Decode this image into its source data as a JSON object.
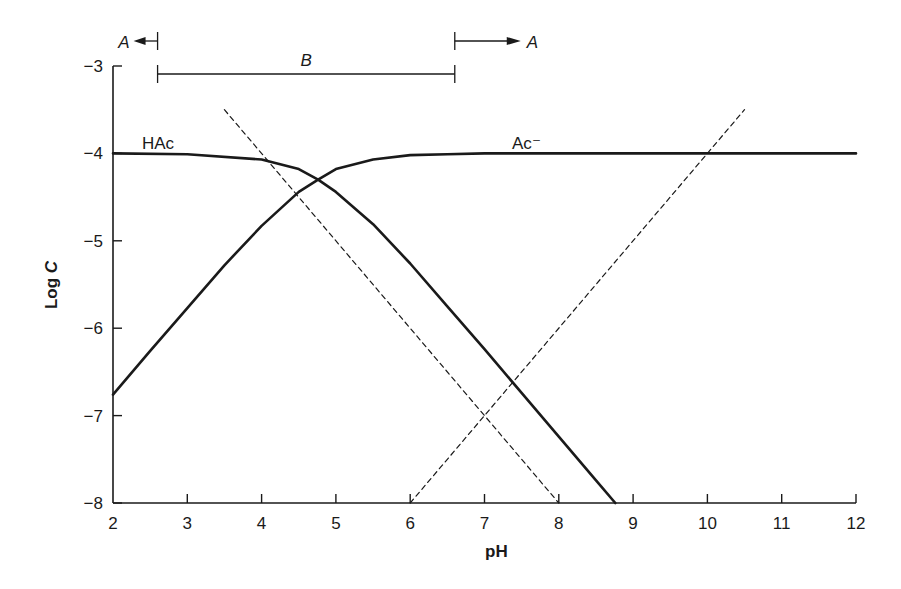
{
  "chart_data": {
    "type": "line",
    "title": "",
    "xlabel": "pH",
    "ylabel": "Log C",
    "ylabel_italic_part": "C",
    "xlim": [
      2,
      12
    ],
    "ylim": [
      -8,
      -3
    ],
    "xticks": [
      2,
      3,
      4,
      5,
      6,
      7,
      8,
      9,
      10,
      11,
      12
    ],
    "yticks": [
      -3,
      -4,
      -5,
      -6,
      -7,
      -8
    ],
    "ytick_labels": [
      "−3",
      "−4",
      "−5",
      "−6",
      "−7",
      "−8"
    ],
    "grid": false,
    "legend": "inline labels",
    "pKa": 4.76,
    "total_log_concentration": -4,
    "series": [
      {
        "name": "HAc",
        "label": "HAc",
        "style": "solid",
        "x": [
          2,
          3,
          4,
          4.5,
          4.76,
          5,
          5.5,
          6,
          6.5,
          7,
          7.5,
          8,
          8.5,
          8.76
        ],
        "values": [
          -4.0,
          -4.01,
          -4.07,
          -4.18,
          -4.3,
          -4.44,
          -4.81,
          -5.26,
          -5.75,
          -6.24,
          -6.74,
          -7.24,
          -7.74,
          -8.0
        ]
      },
      {
        "name": "Ac-",
        "label": "Ac⁻",
        "style": "solid",
        "x": [
          2,
          2.5,
          3,
          3.5,
          4,
          4.5,
          4.76,
          5,
          5.5,
          6,
          6.5,
          7,
          8,
          9,
          10,
          11,
          12
        ],
        "values": [
          -6.76,
          -6.26,
          -5.77,
          -5.28,
          -4.83,
          -4.44,
          -4.3,
          -4.18,
          -4.07,
          -4.02,
          -4.01,
          -4.0,
          -4.0,
          -4.0,
          -4.0,
          -4.0,
          -4.0
        ]
      },
      {
        "name": "H+",
        "label": "",
        "style": "dashed",
        "x": [
          3.5,
          8
        ],
        "values": [
          -3.5,
          -8
        ]
      },
      {
        "name": "OH-",
        "label": "",
        "style": "dashed",
        "x": [
          6,
          10.5
        ],
        "values": [
          -8,
          -3.5
        ]
      }
    ],
    "annotations": [
      {
        "text": "A",
        "type": "arrow-left",
        "from_pH": 2.6,
        "label_side": "left"
      },
      {
        "text": "B",
        "type": "range",
        "from_pH": 2.6,
        "to_pH": 6.6
      },
      {
        "text": "A",
        "type": "arrow-right",
        "from_pH": 6.6,
        "label_side": "right"
      }
    ],
    "series_labels": {
      "HAc": "HAc",
      "Ac": "Ac⁻"
    }
  }
}
